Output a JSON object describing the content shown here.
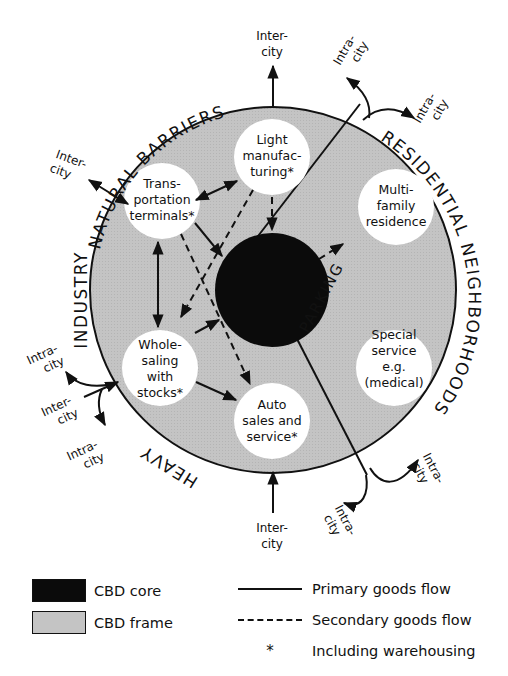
{
  "diagram": {
    "ring_labels": {
      "top": "NATURAL BARRIERS",
      "left": "INDUSTRY",
      "bottom": "HEAVY",
      "right": "RESIDENTIAL NEIGHBORHOODS",
      "inner": "PARKING"
    },
    "nodes": {
      "light_manufacturing": [
        "Light",
        "manufac-",
        "turing*"
      ],
      "transportation_terminals": [
        "Trans-",
        "portation",
        "terminals*"
      ],
      "multi_family": [
        "Multi-",
        "family",
        "residence"
      ],
      "wholesaling": [
        "Whole-",
        "saling",
        "with",
        "stocks*"
      ],
      "special_service": [
        "Special",
        "service",
        "e.g.",
        "(medical)"
      ],
      "auto_sales": [
        "Auto",
        "sales and",
        "service*"
      ]
    },
    "flow_labels": {
      "top_inter": [
        "Inter-",
        "city"
      ],
      "topleft_inter": [
        "Inter-",
        "city"
      ],
      "topright_intra_1": [
        "Intra-",
        "city"
      ],
      "topright_intra_2": [
        "Intra-",
        "city"
      ],
      "left_intra_top": [
        "Intra-",
        "city"
      ],
      "left_inter": [
        "Inter-",
        "city"
      ],
      "left_intra_bottom": [
        "Intra-",
        "city"
      ],
      "bottom_inter": [
        "Inter-",
        "city"
      ],
      "bottomright_intra_1": [
        "Intra-",
        "city"
      ],
      "bottomright_intra_2": [
        "Intra-",
        "city"
      ]
    },
    "colors": {
      "cbd_core": "#0b0b0b",
      "cbd_frame": "#c4c4c4",
      "node_fill": "#ffffff",
      "line": "#111111"
    }
  },
  "legend": {
    "cbd_core": "CBD core",
    "cbd_frame": "CBD frame",
    "primary_flow": "Primary goods flow",
    "secondary_flow": "Secondary goods flow",
    "asterisk_symbol": "*",
    "asterisk_note": "Including warehousing"
  }
}
